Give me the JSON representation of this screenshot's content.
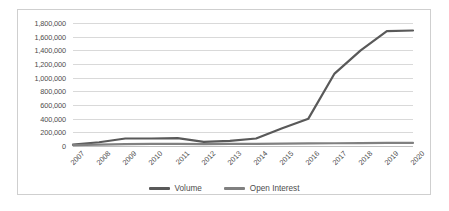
{
  "chart_data": {
    "type": "line",
    "title": "",
    "xlabel": "",
    "ylabel": "",
    "categories": [
      "2007",
      "2008",
      "2009",
      "2010",
      "2011",
      "2012",
      "2013",
      "2014",
      "2015",
      "2016",
      "2017",
      "2018",
      "2019",
      "2020"
    ],
    "series": [
      {
        "name": "Volume",
        "color": "#595959",
        "values": [
          20000,
          55000,
          110000,
          110000,
          115000,
          60000,
          75000,
          110000,
          260000,
          400000,
          1060000,
          1400000,
          1680000,
          1690000
        ]
      },
      {
        "name": "Open Interest",
        "color": "#808080",
        "values": [
          12000,
          20000,
          28000,
          30000,
          32000,
          28000,
          30000,
          32000,
          35000,
          38000,
          40000,
          42000,
          45000,
          45000
        ]
      }
    ],
    "ylim": [
      0,
      1800000
    ],
    "ytick_step": 200000,
    "ytick_labels": [
      "1,800,000",
      "1,600,000",
      "1,400,000",
      "1,200,000",
      "1,000,000",
      "800,000",
      "600,000",
      "400,000",
      "200,000",
      "0"
    ],
    "ytick_values": [
      1800000,
      1600000,
      1400000,
      1200000,
      1000000,
      800000,
      600000,
      400000,
      200000,
      0
    ],
    "grid": true,
    "legend_position": "bottom"
  }
}
